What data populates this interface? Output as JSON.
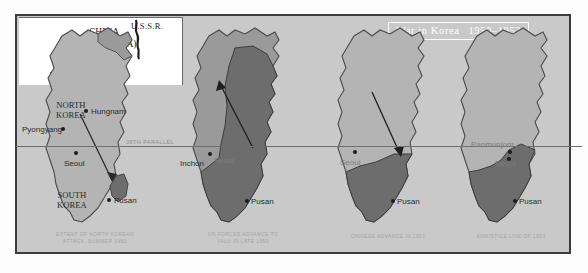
{
  "figure": {
    "title_banner": {
      "text": "War in Korea",
      "years": "1950–1953"
    },
    "background_color": "#c9c9c9",
    "frame_color": "#3c3c3c",
    "shade_light": "#b4b4b4",
    "shade_mid": "#9a9a9a",
    "shade_dark": "#6d6d6d",
    "parallel_label": "38TH PARALLEL"
  },
  "inset": {
    "country_line1": "CHINA",
    "country_line2": "(MANCHURIA)",
    "ussr": "U.S.S.R.",
    "river_word1": "Yalu",
    "river_word2": "River"
  },
  "maps": [
    {
      "id": "map-extent-north-korean-attack",
      "caption_line1": "EXTENT OF NORTH KOREAN",
      "caption_line2": "ATTACK, SUMMER 1950",
      "region_labels": [
        {
          "name": "north-korea",
          "line1": "NORTH",
          "line2": "KOREA"
        },
        {
          "name": "south-korea",
          "line1": "SOUTH",
          "line2": "KOREA"
        }
      ],
      "cities": [
        {
          "name": "pyongyang",
          "label": "Pyongyang"
        },
        {
          "name": "hungnam",
          "label": "Hungnam"
        },
        {
          "name": "seoul",
          "label": "Seoul"
        },
        {
          "name": "pusan",
          "label": "Pusan"
        }
      ]
    },
    {
      "id": "map-un-forces-advance",
      "caption_line1": "UN FORCES ADVANCE TO",
      "caption_line2": "YALU IN LATE 1950",
      "region_labels": [],
      "cities": [
        {
          "name": "inchon",
          "label": "Inchon"
        },
        {
          "name": "seoul",
          "label": "Seoul"
        },
        {
          "name": "pusan",
          "label": "Pusan"
        }
      ]
    },
    {
      "id": "map-chinese-advance",
      "caption_line1": "CHINESE ADVANCE IN 1951",
      "caption_line2": "",
      "region_labels": [],
      "cities": [
        {
          "name": "seoul",
          "label": "Seoul"
        },
        {
          "name": "pusan",
          "label": "Pusan"
        }
      ]
    },
    {
      "id": "map-armistice-line",
      "caption_line1": "ARMISTICE LINE OF 1953",
      "caption_line2": "",
      "region_labels": [],
      "cities": [
        {
          "name": "panmunjom",
          "label": "Panmunjom"
        },
        {
          "name": "seoul",
          "label": "Seoul"
        },
        {
          "name": "pusan",
          "label": "Pusan"
        }
      ]
    }
  ]
}
